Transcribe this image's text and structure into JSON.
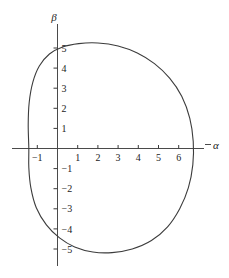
{
  "chart_data": {
    "type": "line",
    "title": "",
    "xlabel": "α",
    "ylabel": "β",
    "grid": false,
    "legend": null,
    "xlim": [
      -2.0,
      7.6
    ],
    "ylim": [
      -5.9,
      5.9
    ],
    "xticks": [
      -1,
      1,
      2,
      3,
      4,
      5,
      6
    ],
    "xtick_labels": [
      "−1",
      "1",
      "2",
      "3",
      "4",
      "5",
      "6"
    ],
    "yticks": [
      5,
      4,
      3,
      2,
      1,
      -1,
      -2,
      -3,
      -4,
      -5
    ],
    "ytick_labels": [
      "5",
      "4",
      "3",
      "2",
      "1",
      "−1",
      "−2",
      "−3",
      "−4",
      "−5"
    ],
    "series": [
      {
        "name": "closed-oval-curve",
        "closed": true,
        "points": [
          [
            -1.42,
            0.0
          ],
          [
            -1.45,
            1.2
          ],
          [
            -1.4,
            2.3
          ],
          [
            -1.22,
            3.3
          ],
          [
            -0.9,
            4.1
          ],
          [
            -0.4,
            4.7
          ],
          [
            0.25,
            5.05
          ],
          [
            1.05,
            5.22
          ],
          [
            2.0,
            5.25
          ],
          [
            3.0,
            5.1
          ],
          [
            3.95,
            4.75
          ],
          [
            4.8,
            4.22
          ],
          [
            5.55,
            3.5
          ],
          [
            6.15,
            2.6
          ],
          [
            6.55,
            1.5
          ],
          [
            6.72,
            0.35
          ],
          [
            6.7,
            -0.8
          ],
          [
            6.48,
            -1.95
          ],
          [
            6.05,
            -3.0
          ],
          [
            5.45,
            -3.9
          ],
          [
            4.65,
            -4.58
          ],
          [
            3.7,
            -5.0
          ],
          [
            2.7,
            -5.18
          ],
          [
            1.75,
            -5.15
          ],
          [
            0.85,
            -4.9
          ],
          [
            0.1,
            -4.45
          ],
          [
            -0.55,
            -3.8
          ],
          [
            -1.05,
            -2.95
          ],
          [
            -1.32,
            -1.95
          ],
          [
            -1.42,
            -0.95
          ],
          [
            -1.42,
            0.0
          ]
        ]
      }
    ]
  },
  "axes": {
    "x_axis_name": "alpha-axis",
    "y_axis_name": "beta-axis",
    "x_label_text": "α",
    "y_label_text": "β"
  },
  "colors": {
    "background": "#ffffff",
    "axis": "#4a4a4a",
    "curve": "#3c3c3c",
    "text": "#222222"
  }
}
